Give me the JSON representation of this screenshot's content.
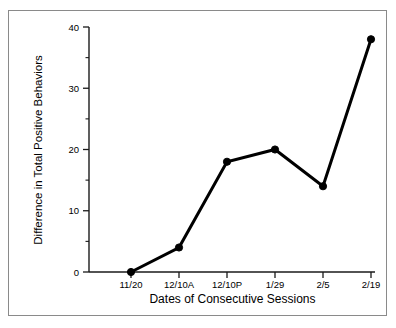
{
  "chart_data": {
    "type": "line",
    "title": "",
    "xlabel": "Dates of Consecutive Sessions",
    "ylabel": "Difference in Total Positive Behaviors",
    "categories": [
      "11/20",
      "12/10A",
      "12/10P",
      "1/29",
      "2/5",
      "2/19"
    ],
    "values": [
      0,
      4,
      18,
      20,
      14,
      38
    ],
    "series": [
      {
        "name": "Difference in Total Positive Behaviors",
        "values": [
          0,
          4,
          18,
          20,
          14,
          38
        ]
      }
    ],
    "ylim": [
      0,
      40
    ],
    "y_major_ticks": [
      0,
      10,
      20,
      30,
      40
    ],
    "y_major_tick_labels": [
      "0",
      "10",
      "20",
      "30",
      "40"
    ],
    "y_minor_ticks": [
      5,
      15,
      25,
      35
    ],
    "grid": false,
    "legend": false,
    "legend_position": "none",
    "marker": "filled-circle",
    "line_color": "#000000",
    "marker_color": "#000000",
    "background_color": "#ffffff",
    "frame_color": "#8a8a8a"
  },
  "axes": {
    "y_tick_0": "0",
    "y_tick_1": "10",
    "y_tick_2": "20",
    "y_tick_3": "30",
    "y_tick_4": "40",
    "x_tick_0": "11/20",
    "x_tick_1": "12/10A",
    "x_tick_2": "12/10P",
    "x_tick_3": "1/29",
    "x_tick_4": "2/5",
    "x_tick_5": "2/19"
  }
}
